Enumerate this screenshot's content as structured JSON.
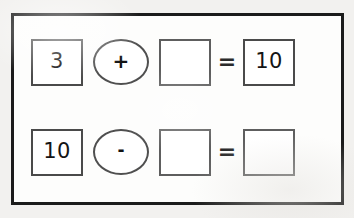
{
  "worksheet": {
    "background_color": "#f2f1ef",
    "page_color": "#fdfdfc",
    "frame_color": "#1b1b1b",
    "box_border_color": "#5e5e5e",
    "ink_color": "#141414",
    "rows": [
      {
        "id": "equation-row-1",
        "operand_left": "3",
        "operator": "+",
        "operator_name": "plus-sign",
        "operand_right": "",
        "equals": "=",
        "result": "10"
      },
      {
        "id": "equation-row-2",
        "operand_left": "10",
        "operator": "-",
        "operator_name": "minus-sign",
        "operand_right": "",
        "equals": "=",
        "result": ""
      }
    ]
  }
}
